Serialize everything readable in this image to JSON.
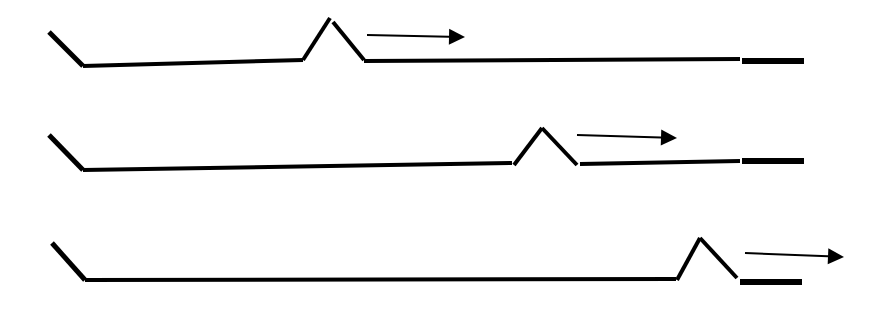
{
  "diagram": {
    "type": "sequential-bump-propagation",
    "stroke_color": "#000000",
    "background": "#ffffff",
    "rows": [
      {
        "index": 1,
        "start_segment": [
          [
            49,
            32
          ],
          [
            83,
            66
          ]
        ],
        "baseline_left": [
          [
            83,
            66
          ],
          [
            303,
            60
          ]
        ],
        "bump_up": [
          [
            303,
            60
          ],
          [
            330,
            18
          ]
        ],
        "bump_down": [
          [
            333,
            22
          ],
          [
            364,
            60
          ]
        ],
        "baseline_right": [
          [
            364,
            61
          ],
          [
            740,
            59
          ]
        ],
        "end_bar": [
          [
            742,
            61
          ],
          [
            804,
            61
          ]
        ],
        "arrow": {
          "from": [
            367,
            35
          ],
          "to": [
            465,
            37
          ]
        }
      },
      {
        "index": 2,
        "start_segment": [
          [
            49,
            135
          ],
          [
            83,
            170
          ]
        ],
        "baseline_left": [
          [
            83,
            170
          ],
          [
            512,
            163
          ]
        ],
        "bump_up": [
          [
            514,
            165
          ],
          [
            542,
            128
          ]
        ],
        "bump_down": [
          [
            542,
            128
          ],
          [
            577,
            165
          ]
        ],
        "baseline_right": [
          [
            580,
            164
          ],
          [
            740,
            161
          ]
        ],
        "end_bar": [
          [
            742,
            161
          ],
          [
            804,
            161
          ]
        ],
        "arrow": {
          "from": [
            577,
            135
          ],
          "to": [
            677,
            138
          ]
        }
      },
      {
        "index": 3,
        "start_segment": [
          [
            52,
            243
          ],
          [
            85,
            280
          ]
        ],
        "baseline_left": [
          [
            85,
            280
          ],
          [
            676,
            279
          ]
        ],
        "bump_up": [
          [
            677,
            280
          ],
          [
            700,
            238
          ]
        ],
        "bump_down": [
          [
            700,
            238
          ],
          [
            737,
            278
          ]
        ],
        "baseline_right": null,
        "end_bar": [
          [
            740,
            282
          ],
          [
            802,
            282
          ]
        ],
        "arrow": {
          "from": [
            745,
            253
          ],
          "to": [
            844,
            257
          ]
        }
      }
    ]
  }
}
